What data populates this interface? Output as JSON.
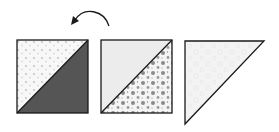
{
  "diagram": {
    "arrow": {
      "type": "curved-arrow",
      "direction": "counter-clockwise",
      "meaning": "rotate / flip"
    },
    "blocks": [
      {
        "id": "block-1",
        "shape": "square",
        "upper_fabric": "light-dotted",
        "lower_fabric": "dark-solid"
      },
      {
        "id": "block-2",
        "shape": "square",
        "upper_fabric": "light-solid",
        "lower_fabric": "floral-print"
      },
      {
        "id": "block-3",
        "shape": "triangle",
        "fabric": "light-print"
      }
    ],
    "colors": {
      "stroke": "#1a1a1a",
      "dark_fabric": "#555555",
      "light_fabric": "#ececec",
      "dotted_bg": "#f7f7f7",
      "dot": "#c8c8c8",
      "floral_bg": "#f4f4f4",
      "floral_motif": "#8a8a8a",
      "triangle_fill": "#f3f3f3"
    }
  }
}
